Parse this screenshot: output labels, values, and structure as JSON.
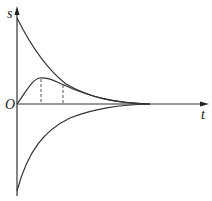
{
  "diagram": {
    "type": "s-t graph",
    "axes": {
      "y_label": "s",
      "x_label": "t",
      "origin_label": "O"
    },
    "curves": [
      {
        "name": "upper-decay-curve",
        "description": "positive curve starting high on s-axis, decaying to t-axis"
      },
      {
        "name": "hump-curve",
        "description": "curve from origin rising to a peak then decaying, tangent to upper curve"
      },
      {
        "name": "lower-decay-curve",
        "description": "negative curve starting low on s-axis, rising to t-axis"
      }
    ],
    "dashed_lines": [
      {
        "name": "peak-marker",
        "description": "vertical dashed line at hump peak"
      },
      {
        "name": "tangent-marker",
        "description": "vertical dashed line where hump meets upper curve"
      }
    ],
    "colors": {
      "line": "#333333",
      "background": "#ffffff"
    }
  }
}
